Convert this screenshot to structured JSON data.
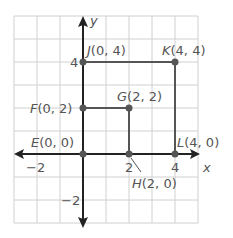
{
  "diagram": {
    "type": "coordinate-grid",
    "axes": {
      "x_label": "x",
      "y_label": "y",
      "x_ticks": [
        {
          "value": -2,
          "label": "−2"
        },
        {
          "value": 2,
          "label": "2"
        },
        {
          "value": 4,
          "label": "4"
        }
      ],
      "y_ticks": [
        {
          "value": 4,
          "label": "4"
        },
        {
          "value": -2,
          "label": "−2"
        }
      ],
      "x_range": [
        -3,
        5
      ],
      "y_range": [
        -3,
        6
      ]
    },
    "points": [
      {
        "name": "E",
        "coords": "(0, 0)",
        "x": 0,
        "y": 0
      },
      {
        "name": "F",
        "coords": "(0, 2)",
        "x": 0,
        "y": 2
      },
      {
        "name": "G",
        "coords": "(2, 2)",
        "x": 2,
        "y": 2
      },
      {
        "name": "H",
        "coords": "(2, 0)",
        "x": 2,
        "y": 0
      },
      {
        "name": "J",
        "coords": "(0, 4)",
        "x": 0,
        "y": 4
      },
      {
        "name": "K",
        "coords": "(4, 4)",
        "x": 4,
        "y": 4
      },
      {
        "name": "L",
        "coords": "(4, 0)",
        "x": 4,
        "y": 0
      }
    ],
    "shapes": [
      {
        "name": "square-EFGH",
        "vertices": [
          "E",
          "F",
          "G",
          "H"
        ]
      },
      {
        "name": "square-EJKL",
        "vertices": [
          "E",
          "J",
          "K",
          "L"
        ]
      }
    ],
    "colors": {
      "grid": "#d0d0d0",
      "axis": "#222222",
      "shape": "#555555",
      "label": "#555555"
    }
  }
}
